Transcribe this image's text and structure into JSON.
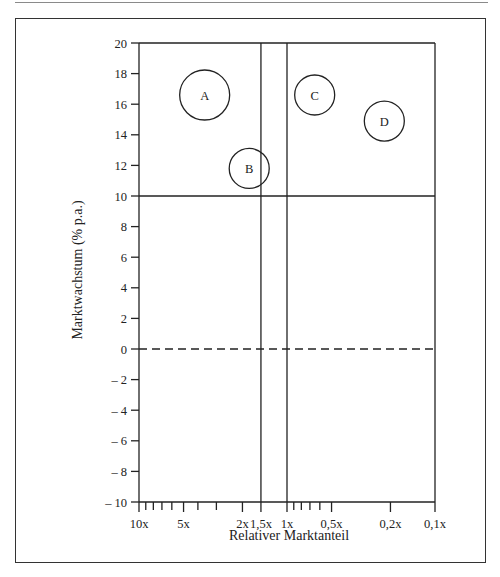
{
  "chart_data": {
    "type": "scatter",
    "subtype": "bcg-portfolio-matrix",
    "title": "",
    "xlabel": "Relativer Marktanteil",
    "ylabel": "Marktwachstum (% p.a.)",
    "x_scale": "log-reversed",
    "x_tick_labels": [
      "10x",
      "5x",
      "2x",
      "1,5x",
      "1x",
      "0,5x",
      "0,2x",
      "0,1x"
    ],
    "y_ticks": [
      20,
      18,
      16,
      14,
      12,
      10,
      8,
      6,
      4,
      2,
      0,
      -2,
      -4,
      -6,
      -8,
      -10
    ],
    "y_tick_labels": [
      "20",
      "18",
      "16",
      "14",
      "12",
      "10",
      "8",
      "6",
      "4",
      "2",
      "0",
      "– 2",
      "– 4",
      "– 6",
      "– 8",
      "– 10"
    ],
    "ylim": [
      -10,
      20
    ],
    "xlim": [
      "10x",
      "0,1x"
    ],
    "reference_lines": [
      {
        "type": "horizontal",
        "y": 10,
        "style": "solid"
      },
      {
        "type": "horizontal",
        "y": 0,
        "style": "dashed"
      },
      {
        "type": "vertical",
        "x": 1.5,
        "style": "solid"
      },
      {
        "type": "vertical",
        "x": 1.0,
        "style": "solid"
      }
    ],
    "points": [
      {
        "label": "A",
        "relative_market_share": 3.6,
        "market_growth": 16.6,
        "size": "large"
      },
      {
        "label": "B",
        "relative_market_share": 1.8,
        "market_growth": 11.8,
        "size": "medium"
      },
      {
        "label": "C",
        "relative_market_share": 0.65,
        "market_growth": 16.6,
        "size": "medium"
      },
      {
        "label": "D",
        "relative_market_share": 0.22,
        "market_growth": 14.9,
        "size": "medium"
      }
    ],
    "grid": false,
    "legend": null
  }
}
